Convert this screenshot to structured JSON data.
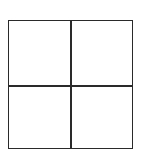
{
  "diagram": {
    "type": "grid",
    "rows": 2,
    "columns": 2,
    "cells": [
      {
        "row": 0,
        "col": 0,
        "label": ""
      },
      {
        "row": 0,
        "col": 1,
        "label": ""
      },
      {
        "row": 1,
        "col": 0,
        "label": ""
      },
      {
        "row": 1,
        "col": 1,
        "label": ""
      }
    ],
    "colors": {
      "line": "#2a2a2a",
      "background": "#ffffff"
    }
  }
}
